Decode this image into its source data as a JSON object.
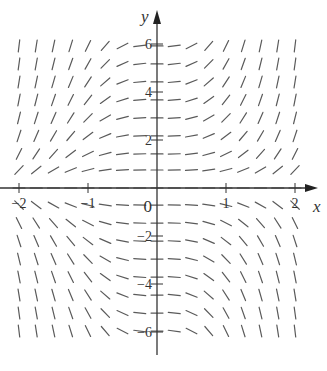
{
  "chart_data": {
    "type": "slope_field",
    "title": "",
    "xlabel": "x",
    "ylabel": "y",
    "equation_form": "dy/dx = x^2 * y",
    "xlim": [
      -2.2,
      2.4
    ],
    "ylim": [
      -6.8,
      7.8
    ],
    "x_ticks": [
      -2,
      -1,
      1,
      2
    ],
    "y_ticks": [
      -6,
      -4,
      -2,
      2,
      4,
      6
    ],
    "x_tick_labels": [
      "-2",
      "-1",
      "1",
      "2"
    ],
    "y_tick_labels": [
      "-6",
      "-4",
      "-2",
      "2",
      "4",
      "6"
    ],
    "origin_label": "0",
    "grid": {
      "x_values": [
        -2,
        -1.75,
        -1.5,
        -1.25,
        -1,
        -0.75,
        -0.5,
        -0.25,
        0,
        0.25,
        0.5,
        0.75,
        1,
        1.25,
        1.5,
        1.75,
        2
      ],
      "y_values": [
        5.92,
        5.17,
        4.42,
        3.67,
        2.92,
        2.17,
        1.42,
        0.75,
        0,
        -0.71,
        -1.46,
        -2.21,
        -2.96,
        -3.71,
        -4.46,
        -5.21,
        -5.96
      ]
    },
    "segment_length_px": 12,
    "colors": {
      "segment": "#5a5a5a",
      "axis": "#333333",
      "text": "#333333"
    }
  },
  "frame": {
    "width": 327,
    "height": 371,
    "origin_px": [
      157,
      188
    ],
    "px_per_unit_x": 69,
    "px_per_unit_y": 24
  }
}
